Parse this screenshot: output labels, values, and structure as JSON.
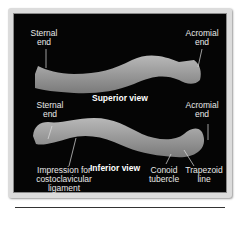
{
  "figure": {
    "superior": {
      "title": "Superior view",
      "labels": {
        "sternal_end": "Sternal\nend",
        "acromial_end": "Acromial\nend"
      }
    },
    "inferior": {
      "title": "Inferior view",
      "labels": {
        "sternal_end": "Sternal\nend",
        "acromial_end": "Acromial\nend",
        "costoclavicular": "Impression for\ncostoclavicular\nligament",
        "conoid_tubercle": "Conoid\ntubercle",
        "trapezoid_line": "Trapezoid\nline"
      }
    },
    "colors": {
      "background": "#050505",
      "frame": "#dcdcdc",
      "bone": "#a8a8a8",
      "label": "#e8e8e8"
    }
  }
}
